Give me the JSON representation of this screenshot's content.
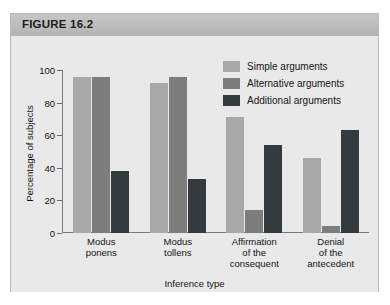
{
  "figure": {
    "header_label": "FIGURE 16.2"
  },
  "chart_data": {
    "type": "bar",
    "title": "FIGURE 16.2",
    "xlabel": "Inference type",
    "ylabel": "Percentage of subjects",
    "ylim": [
      0,
      100
    ],
    "yticks": [
      0,
      20,
      40,
      60,
      80,
      100
    ],
    "grid": false,
    "legend_position": "top-right",
    "categories": [
      "Modus ponens",
      "Modus tollens",
      "Affirmation of the consequent",
      "Denial of the antecedent"
    ],
    "category_lines": [
      [
        "Modus",
        "ponens"
      ],
      [
        "Modus",
        "tollens"
      ],
      [
        "Affirmation",
        "of the",
        "consequent"
      ],
      [
        "Denial",
        "of the",
        "antecedent"
      ]
    ],
    "series": [
      {
        "name": "Simple arguments",
        "color": "#a8a8a8",
        "values": [
          96,
          92,
          71,
          46
        ]
      },
      {
        "name": "Alternative arguments",
        "color": "#7d7d7d",
        "values": [
          96,
          96,
          14,
          4
        ]
      },
      {
        "name": "Additional arguments",
        "color": "#333a3d",
        "values": [
          38,
          33,
          54,
          63
        ]
      }
    ]
  }
}
